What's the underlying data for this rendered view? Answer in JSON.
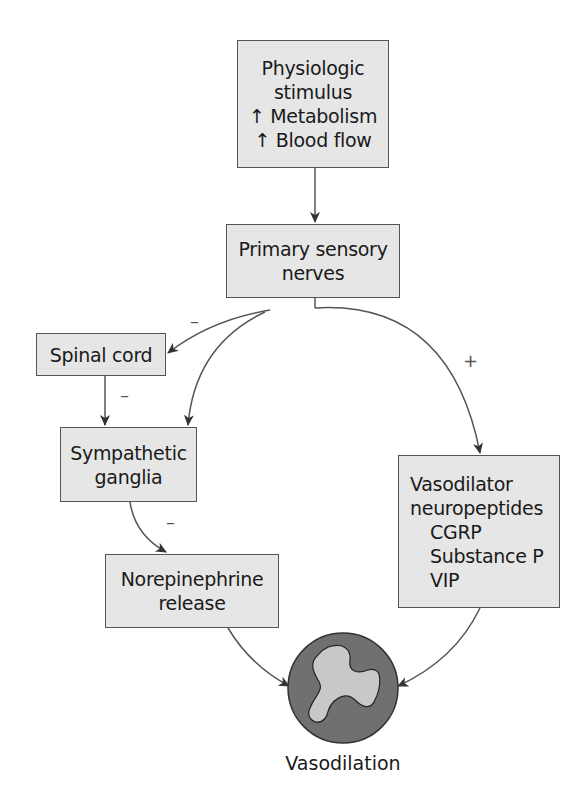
{
  "nodes": {
    "stimulus": {
      "lines": [
        "Physiologic",
        "stimulus",
        "↑ Metabolism",
        "↑ Blood flow"
      ]
    },
    "sensory": {
      "lines": [
        "Primary sensory",
        "nerves"
      ]
    },
    "spinal": {
      "lines": [
        "Spinal cord"
      ]
    },
    "ganglia": {
      "lines": [
        "Sympathetic",
        "ganglia"
      ]
    },
    "norepi": {
      "lines": [
        "Norepinephrine",
        "release"
      ]
    },
    "vasodilator": {
      "lines": [
        "Vasodilator",
        "neuropeptides",
        "CGRP",
        "Substance P",
        "VIP"
      ]
    },
    "outcome": {
      "label": "Vasodilation"
    }
  },
  "edge_signs": {
    "sensory_to_spinal": "–",
    "spinal_to_ganglia": "–",
    "ganglia_to_norepi": "–",
    "sensory_to_vasodilator": "+"
  },
  "colors": {
    "box_fill": "#e6e6e6",
    "border": "#555555",
    "vessel_outer": "#6e6e6e",
    "vessel_lumen": "#c8c8c8"
  }
}
